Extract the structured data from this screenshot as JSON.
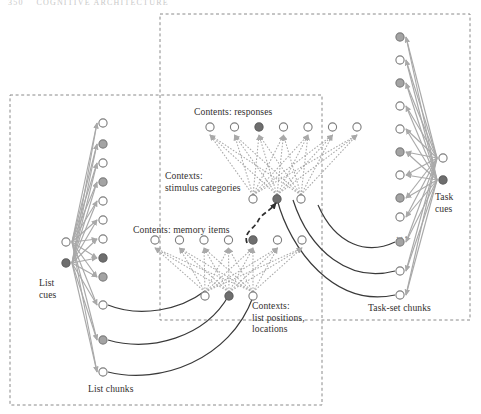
{
  "figure": {
    "header_faint": "350    COGNITIVE ARCHITECTURE",
    "background": "#ffffff",
    "box_stroke": "#8a8a8a",
    "link_gray": "#a9a9a9",
    "link_dark": "#3a3a3a",
    "node_stroke": "#7d7d7d",
    "node_white": "#ffffff",
    "node_gray": "#a3a3a3",
    "node_dark": "#6e6e6e"
  },
  "labels": {
    "list_cues": "List\ncues",
    "list_chunks": "List chunks",
    "contents_memory_items": "Contents: memory items",
    "contexts_list_positions": "Contexts:\nlist positions,\nlocations",
    "contents_responses": "Contents: responses",
    "contexts_stimulus_categories": "Contexts:\nstimulus categories",
    "task_cues": "Task\ncues",
    "task_set_chunks": "Task-set chunks",
    "ellipsis": "..."
  },
  "modules": {
    "list_module": {
      "name": "list-memory-module",
      "box": {
        "x": 10,
        "y": 95,
        "w": 312,
        "h": 310
      },
      "cues": [
        {
          "id": "lc1",
          "fill": "white"
        },
        {
          "id": "lc2",
          "fill": "dark"
        }
      ],
      "chunks": [
        {
          "id": "ch1",
          "fill": "white"
        },
        {
          "id": "ch2",
          "fill": "gray"
        },
        {
          "id": "ch3",
          "fill": "white"
        },
        {
          "id": "ch4",
          "fill": "gray"
        },
        {
          "id": "ch5",
          "fill": "white"
        },
        {
          "id": "ch6",
          "fill": "white"
        },
        {
          "id": "ch7",
          "fill": "white"
        },
        {
          "id": "ch8",
          "fill": "dark"
        },
        {
          "id": "ch9",
          "fill": "gray"
        },
        {
          "id": "ch10",
          "fill": "white"
        },
        {
          "id": "ch11",
          "fill": "gray"
        },
        {
          "id": "ch12",
          "fill": "white"
        }
      ]
    },
    "task_module": {
      "name": "task-set-module",
      "box": {
        "x": 160,
        "y": 14,
        "w": 310,
        "h": 306
      },
      "cues": [
        {
          "id": "tc1",
          "fill": "white"
        },
        {
          "id": "tc2",
          "fill": "dark"
        }
      ],
      "chunks": [
        {
          "id": "tk1",
          "fill": "gray"
        },
        {
          "id": "tk2",
          "fill": "white"
        },
        {
          "id": "tk3",
          "fill": "gray"
        },
        {
          "id": "tk4",
          "fill": "white"
        },
        {
          "id": "tk5",
          "fill": "white"
        },
        {
          "id": "tk6",
          "fill": "gray"
        },
        {
          "id": "tk7",
          "fill": "white"
        },
        {
          "id": "tk8",
          "fill": "gray"
        },
        {
          "id": "tk9",
          "fill": "white"
        },
        {
          "id": "tk10",
          "fill": "gray"
        },
        {
          "id": "tk11",
          "fill": "white"
        },
        {
          "id": "tk12",
          "fill": "white"
        }
      ]
    }
  },
  "networks": {
    "memory_net": {
      "name": "memory-items-network",
      "contents_row": [
        {
          "fill": "white"
        },
        {
          "fill": "white"
        },
        {
          "fill": "white"
        },
        {
          "fill": "white"
        },
        {
          "fill": "dark"
        },
        {
          "fill": "white"
        },
        {
          "fill": "white"
        }
      ],
      "contexts_row": [
        {
          "fill": "white"
        },
        {
          "fill": "dark"
        },
        {
          "fill": "white"
        }
      ]
    },
    "response_net": {
      "name": "responses-network",
      "contents_row": [
        {
          "fill": "white"
        },
        {
          "fill": "white"
        },
        {
          "fill": "dark"
        },
        {
          "fill": "white"
        },
        {
          "fill": "white"
        },
        {
          "fill": "white"
        },
        {
          "fill": "white"
        }
      ],
      "contexts_row": [
        {
          "fill": "white"
        },
        {
          "fill": "dark"
        },
        {
          "fill": "white"
        }
      ]
    }
  },
  "connector": {
    "name": "memory-to-category-link",
    "style": "dashed-curved-arrow"
  }
}
